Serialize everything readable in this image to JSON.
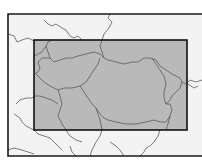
{
  "map": {
    "type": "locator-map",
    "region": "South-eastern Europe",
    "colors": {
      "page_background": "#ffffff",
      "map_background": "#f3f3f3",
      "highlight_fill": "#b9b9b9",
      "frame_stroke": "#1a1a1a",
      "border_stroke": "#5a5a5a"
    },
    "outer_frame": {
      "x": 8,
      "y": 14,
      "width": 200,
      "height": 142
    },
    "highlight_box": {
      "x": 34,
      "y": 40,
      "width": 153,
      "height": 90
    }
  }
}
